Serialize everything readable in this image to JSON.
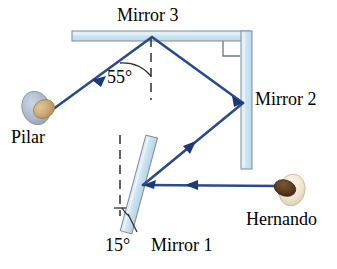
{
  "figure": {
    "labels": {
      "mirror3": "Mirror 3",
      "mirror2": "Mirror 2",
      "mirror1": "Mirror 1",
      "angle_55": "55°",
      "angle_15": "15°",
      "pilar": "Pilar",
      "hernando": "Hernando"
    },
    "angles": {
      "mirror3_reflection_deg": 55,
      "mirror1_tilt_deg": 15,
      "mirror2_mirror3_corner_deg": 90
    },
    "colors": {
      "ray": "#2a4a8c",
      "ray_dark": "#1d3a73",
      "mirror_fill": "#cfe4f2",
      "mirror_edge": "#7f8c96",
      "pilar_hair": "#aebbcd",
      "pilar_face": "#c9a775",
      "hernando_hair": "#5a3a22",
      "hernando_face": "#efe3cf",
      "text": "#000000",
      "background": "#ffffff",
      "normal_dash": "#3a3a3a"
    },
    "elements": {
      "mirror3_name": "horizontal-mirror-top",
      "mirror2_name": "vertical-mirror-right",
      "mirror1_name": "tilted-mirror-bottom",
      "normal_mirror3_name": "normal-line-mirror3",
      "normal_mirror1_name": "normal-line-mirror1",
      "right_angle_marker": "right-angle-marker"
    },
    "ray_path": {
      "description": "Hernando -> Mirror 1 -> Mirror 2 -> Mirror 3 -> Pilar",
      "points": [
        {
          "name": "hernando",
          "x": 283,
          "y": 186
        },
        {
          "name": "mirror1-hit",
          "x": 143,
          "y": 185
        },
        {
          "name": "mirror2-hit",
          "x": 243,
          "y": 103
        },
        {
          "name": "mirror3-hit",
          "x": 152,
          "y": 37
        },
        {
          "name": "pilar",
          "x": 52,
          "y": 110
        }
      ]
    }
  }
}
